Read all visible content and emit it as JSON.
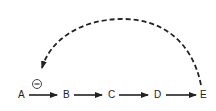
{
  "diagram": {
    "type": "feedback-inhibition-pathway",
    "nodes": [
      {
        "id": "A",
        "label": "A"
      },
      {
        "id": "B",
        "label": "B"
      },
      {
        "id": "C",
        "label": "C"
      },
      {
        "id": "D",
        "label": "D"
      },
      {
        "id": "E",
        "label": "E"
      }
    ],
    "edges": [
      {
        "from": "A",
        "to": "B",
        "style": "solid"
      },
      {
        "from": "B",
        "to": "C",
        "style": "solid"
      },
      {
        "from": "C",
        "to": "D",
        "style": "solid"
      },
      {
        "from": "D",
        "to": "E",
        "style": "solid"
      },
      {
        "from": "E",
        "to": "A",
        "style": "dashed",
        "curved": true
      }
    ],
    "inhibition_symbol": "−",
    "colors": {
      "stroke": "#222222",
      "background": "#ffffff"
    }
  }
}
